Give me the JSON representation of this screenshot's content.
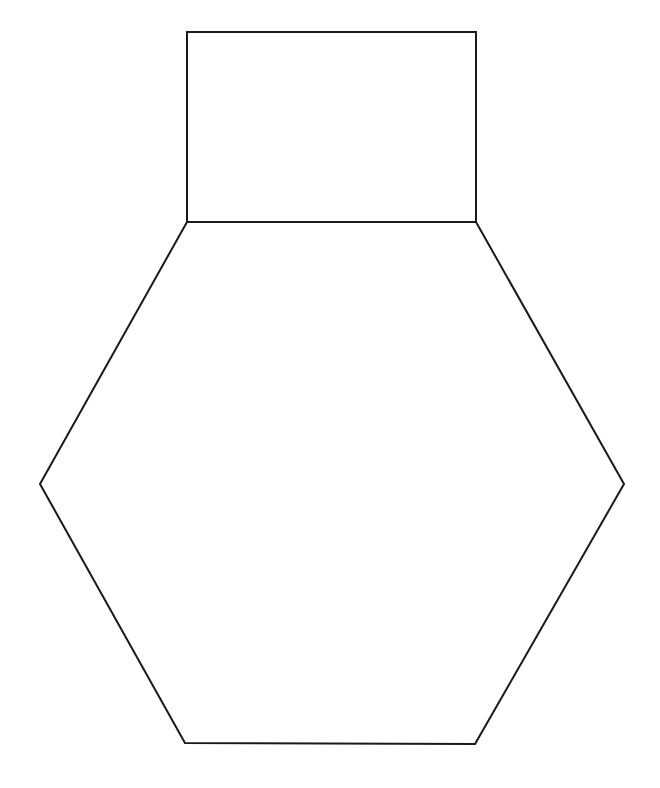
{
  "diagram": {
    "stroke_color": "#1a1a1a",
    "background_color": "#ffffff",
    "shapes": [
      {
        "name": "rectangle",
        "points": "187,32 476,32 476,222 187,222"
      },
      {
        "name": "hexagon",
        "points": "187,222 476,222 624,484 475,744 185,743 40,484"
      }
    ]
  }
}
